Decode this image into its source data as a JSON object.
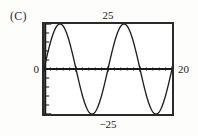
{
  "figure": {
    "part_label": "(C)",
    "colors": {
      "background": "#fdfdfc",
      "plot_background": "#ffffff",
      "frame": "#2a2a2a",
      "curve": "#1f1f1f",
      "axis": "#1a1a1a",
      "text": "#222222"
    }
  },
  "labels": {
    "y_max": "25",
    "y_min": "−25",
    "y_origin": "0",
    "x_max": "20"
  },
  "chart_data": {
    "type": "line",
    "title": "(C)",
    "xlabel": "",
    "ylabel": "",
    "xlim": [
      0,
      20
    ],
    "ylim": [
      -25,
      25
    ],
    "grid": false,
    "legend": null,
    "axis_tick_labels": {
      "x": [
        "0",
        "20"
      ],
      "y": [
        "-25",
        "0",
        "25"
      ]
    },
    "annotations": [
      {
        "text": "25",
        "position": "above-plot-top-center",
        "value": 25
      },
      {
        "text": "-25",
        "position": "below-plot-bottom-center",
        "value": -25
      },
      {
        "text": "0",
        "position": "left-of-y-axis-at-origin",
        "value": 0
      },
      {
        "text": "20",
        "position": "right-of-plot-at-axis",
        "value": 20
      }
    ],
    "x_major_ticks": [
      0,
      5,
      10,
      15,
      20
    ],
    "x_minor_tick_interval": 1,
    "y_major_ticks": [
      -25,
      0,
      25
    ],
    "y_minor_tick_interval": 5,
    "series": [
      {
        "name": "y = 25 sin(2πx/10)",
        "amplitude": 25,
        "period": 10,
        "phase": 0,
        "cycles_shown": 2,
        "x": [
          0,
          0.5,
          1,
          1.5,
          2,
          2.5,
          3,
          3.5,
          4,
          4.5,
          5,
          5.5,
          6,
          6.5,
          7,
          7.5,
          8,
          8.5,
          9,
          9.5,
          10,
          10.5,
          11,
          11.5,
          12,
          12.5,
          13,
          13.5,
          14,
          14.5,
          15,
          15.5,
          16,
          16.5,
          17,
          17.5,
          18,
          18.5,
          19,
          19.5,
          20
        ],
        "values": [
          0,
          7.73,
          14.69,
          20.23,
          23.78,
          25,
          23.78,
          20.23,
          14.69,
          7.73,
          0,
          -7.73,
          -14.69,
          -20.23,
          -23.78,
          -25,
          -23.78,
          -20.23,
          -14.69,
          -7.73,
          0,
          7.73,
          14.69,
          20.23,
          23.78,
          25,
          23.78,
          20.23,
          14.69,
          7.73,
          0,
          -7.73,
          -14.69,
          -20.23,
          -23.78,
          -25,
          -23.78,
          -20.23,
          -14.69,
          -7.73,
          0
        ],
        "key_points": {
          "maxima_x": [
            2.5,
            12.5
          ],
          "minima_x": [
            7.5,
            17.5
          ],
          "zeros_x": [
            0,
            5,
            10,
            15,
            20
          ]
        }
      }
    ]
  }
}
